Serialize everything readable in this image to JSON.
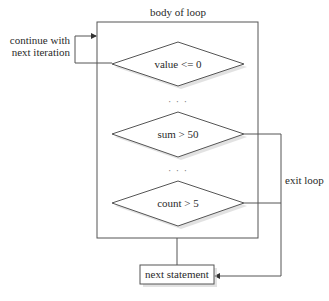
{
  "diagram": {
    "container": {
      "label": "body of loop"
    },
    "decisions": [
      {
        "label": "value <= 0"
      },
      {
        "label": "sum > 50"
      },
      {
        "label": "count > 5"
      }
    ],
    "ellipsis": "· · ·",
    "continue_label": {
      "line1": "continue with",
      "line2": "next iteration"
    },
    "exit_label": "exit loop",
    "next_statement": {
      "label": "next statement"
    },
    "colors": {
      "stroke": "#555555",
      "text": "#2a2a2a",
      "shadow": "#cfcfcf"
    }
  }
}
